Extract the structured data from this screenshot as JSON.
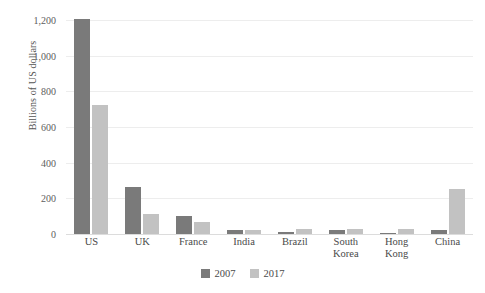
{
  "chart_data": {
    "type": "bar",
    "title": "",
    "subtitle": "",
    "xlabel": "",
    "ylabel": "Billions of US dollars",
    "ylim": [
      0,
      1200
    ],
    "yticks": [
      0,
      200,
      400,
      600,
      800,
      1000,
      1200
    ],
    "ytick_labels": [
      "0",
      "200",
      "400",
      "600",
      "800",
      "1,000",
      "1,200"
    ],
    "grid": true,
    "legend_position": "bottom-center",
    "categories": [
      "US",
      "UK",
      "France",
      "India",
      "Brazil",
      "South Korea",
      "Hong Kong",
      "China"
    ],
    "category_lines": [
      [
        "US"
      ],
      [
        "UK"
      ],
      [
        "France"
      ],
      [
        "India"
      ],
      [
        "Brazil"
      ],
      [
        "South",
        "Korea"
      ],
      [
        "Hong",
        "Kong"
      ],
      [
        "China"
      ]
    ],
    "series": [
      {
        "name": "2007",
        "color": "#7a7a7a",
        "values": [
          1205,
          265,
          100,
          22,
          13,
          25,
          8,
          22
        ]
      },
      {
        "name": "2017",
        "color": "#c2c2c2",
        "values": [
          725,
          115,
          70,
          20,
          27,
          26,
          27,
          255
        ]
      }
    ]
  },
  "legend": {
    "items": [
      {
        "label": "2007",
        "color": "#7a7a7a"
      },
      {
        "label": "2017",
        "color": "#c2c2c2"
      }
    ]
  },
  "colors": {
    "background": "#ffffff",
    "gridline": "#ededed",
    "axis": "#dcdcdc",
    "text": "#4a4a4a",
    "tick_text": "#5d5d5d"
  }
}
